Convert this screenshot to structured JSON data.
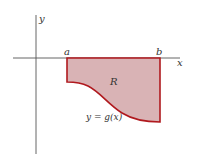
{
  "diagram": {
    "axes": {
      "x_label": "x",
      "y_label": "y",
      "color": "#555555"
    },
    "region": {
      "label": "R",
      "fill": "#d9b3b5",
      "stroke": "#b0191e"
    },
    "bounds": {
      "left_label": "a",
      "right_label": "b"
    },
    "curve": {
      "label": "y = g(x)"
    }
  }
}
